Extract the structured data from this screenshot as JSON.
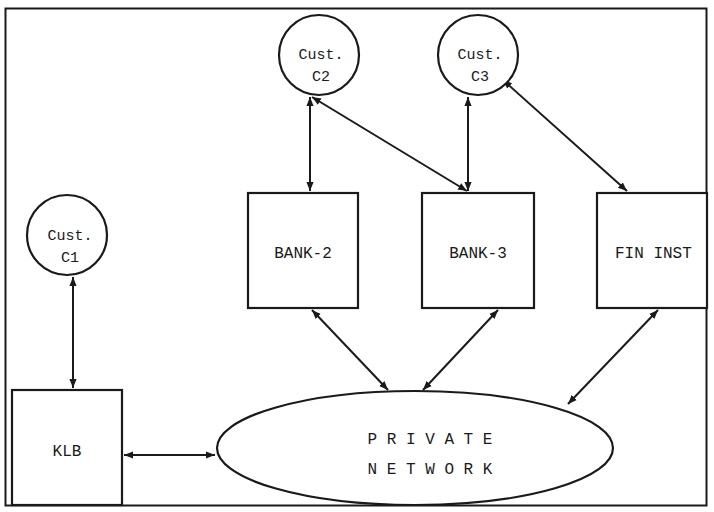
{
  "diagram": {
    "type": "network-topology",
    "colors": {
      "stroke": "#1a1a1a",
      "fill": "#ffffff",
      "text": "#1a1a1a"
    },
    "customers": [
      {
        "id": "c1",
        "line1": "Cust.",
        "line2": "C1"
      },
      {
        "id": "c2",
        "line1": "Cust.",
        "line2": "C2"
      },
      {
        "id": "c3",
        "line1": "Cust.",
        "line2": "C3"
      }
    ],
    "institutions": [
      {
        "id": "bank2",
        "label": "BANK-2"
      },
      {
        "id": "bank3",
        "label": "BANK-3"
      },
      {
        "id": "fininst",
        "label": "FIN INST"
      },
      {
        "id": "klb",
        "label": "KLB"
      }
    ],
    "network": {
      "line1": "P R I V A T E",
      "line2": "N E T W O R K"
    },
    "connections": [
      {
        "from": "c1",
        "to": "klb",
        "bidirectional": true
      },
      {
        "from": "c2",
        "to": "bank2",
        "bidirectional": true
      },
      {
        "from": "c2",
        "to": "bank3",
        "bidirectional": true
      },
      {
        "from": "c3",
        "to": "bank3",
        "bidirectional": true
      },
      {
        "from": "c3",
        "to": "fininst",
        "bidirectional": true
      },
      {
        "from": "klb",
        "to": "network",
        "bidirectional": true
      },
      {
        "from": "bank2",
        "to": "network",
        "bidirectional": true
      },
      {
        "from": "bank3",
        "to": "network",
        "bidirectional": true
      },
      {
        "from": "fininst",
        "to": "network",
        "bidirectional": true
      }
    ]
  }
}
